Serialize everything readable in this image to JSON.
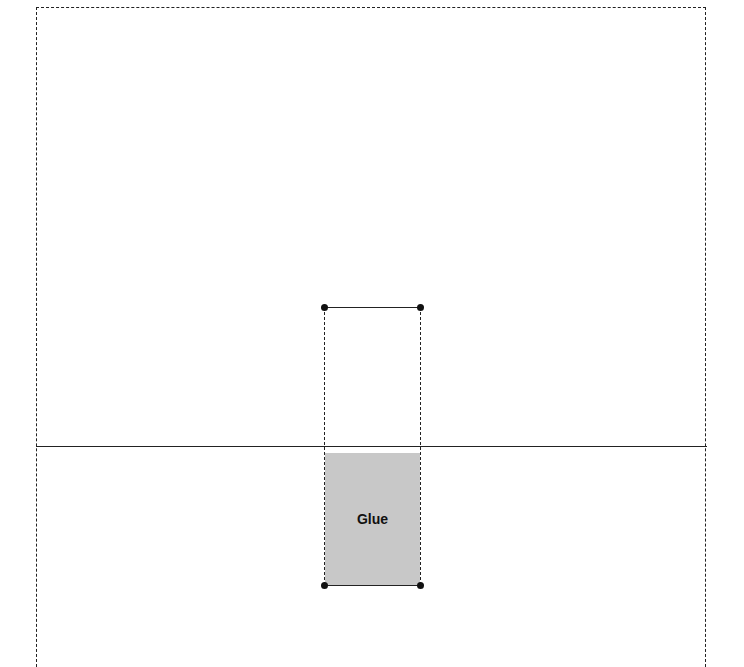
{
  "diagram": {
    "type": "glue-tab template",
    "glue_label": "Glue",
    "colors": {
      "line": "#222222",
      "glue_fill": "#c8c8c8",
      "vertex": "#111111",
      "background": "#ffffff"
    },
    "outer_panel": {
      "left": 36,
      "top": 7,
      "right": 707,
      "border": "dashed",
      "bottom_edge": "open"
    },
    "fold_line": {
      "y": 446,
      "x_start": 36,
      "x_end": 707,
      "style": "solid"
    },
    "tab": {
      "x_left": 324,
      "x_right": 420,
      "y_top": 307,
      "y_bottom": 585,
      "sides": "dashed",
      "top_bottom_edges": "solid"
    },
    "vertices": [
      {
        "x": 324,
        "y": 307
      },
      {
        "x": 420,
        "y": 307
      },
      {
        "x": 324,
        "y": 585
      },
      {
        "x": 420,
        "y": 585
      }
    ]
  }
}
